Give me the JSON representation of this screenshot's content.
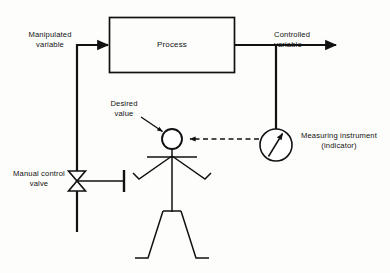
{
  "diagram": {
    "type": "process-control-block-diagram",
    "colors": {
      "line": "#111111",
      "background": "#fdfdfb",
      "text": "#111111"
    },
    "blocks": [
      {
        "id": "process",
        "label": "Process",
        "shape": "rectangle"
      }
    ],
    "labels": {
      "manipulated_variable": "Manipulated\nvariable",
      "controlled_variable": "Controlled\nvariable",
      "desired_value": "Desired\nvalue",
      "manual_control_valve": "Manual control\nvalve",
      "measuring_instrument": "Measuring instrument\n(indicator)",
      "process": "Process"
    },
    "symbols": [
      {
        "id": "manual-control-valve",
        "kind": "bowtie-valve",
        "note": "hand-operated valve on manipulated variable line"
      },
      {
        "id": "measuring-instrument",
        "kind": "gauge-circle-with-needle",
        "note": "indicator sensing controlled variable"
      },
      {
        "id": "operator",
        "kind": "stick-figure",
        "note": "human operator closing the loop"
      },
      {
        "id": "setpoint-node",
        "kind": "small-circle",
        "note": "operator head / desired value summing point"
      }
    ],
    "signals": [
      {
        "id": "manipulated-signal",
        "style": "solid",
        "from": "manual-control-valve",
        "to": "process",
        "arrow": true
      },
      {
        "id": "controlled-signal",
        "style": "solid",
        "from": "process",
        "to": "output",
        "arrow": true
      },
      {
        "id": "measurement-signal",
        "style": "dashed",
        "from": "measuring-instrument",
        "to": "setpoint-node",
        "arrow": true
      },
      {
        "id": "desired-value-leader",
        "style": "solid-leader",
        "from": "desired_value-label",
        "to": "setpoint-node",
        "arrow": true
      }
    ]
  }
}
